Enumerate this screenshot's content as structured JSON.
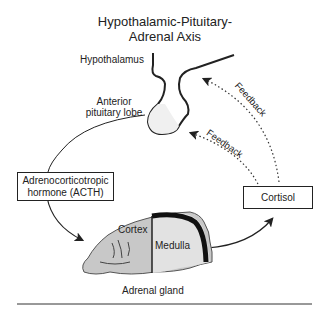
{
  "title": {
    "line1": "Hypothalamic-Pituitary-",
    "line2": "Adrenal Axis"
  },
  "labels": {
    "hypothalamus": "Hypothalamus",
    "anterior_line1": "Anterior",
    "anterior_line2": "pituitary lobe",
    "acth_line1": "Adrenocorticotropic",
    "acth_line2": "hormone (ACTH)",
    "cortisol": "Cortisol",
    "cortex": "Cortex",
    "medulla": "Medulla",
    "adrenal_gland": "Adrenal gland",
    "feedback_upper": "Feedback",
    "feedback_lower": "Feedback"
  },
  "colors": {
    "line": "#222222",
    "gland_fill": "#c8c8c8",
    "medulla_fill": "#e2e2e2",
    "pituitary_fill": "#f0f0f0"
  }
}
